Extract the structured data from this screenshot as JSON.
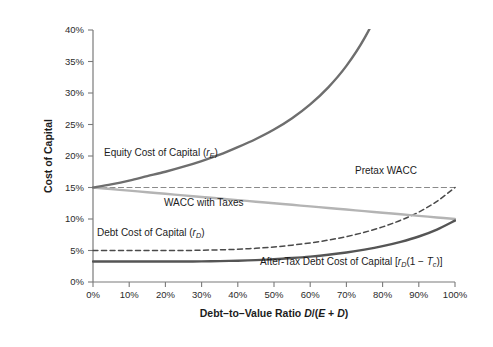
{
  "chart_data": {
    "type": "line",
    "title": "",
    "xlabel": "Debt-to-Value Ratio D/(E + D)",
    "ylabel": "Cost of Capital",
    "xlim": [
      0,
      100
    ],
    "ylim": [
      0,
      40
    ],
    "grid": false,
    "legend_position": "inline-annotations",
    "x_tick_labels": [
      "0%",
      "10%",
      "20%",
      "30%",
      "40%",
      "50%",
      "60%",
      "70%",
      "80%",
      "90%",
      "100%"
    ],
    "x_ticks": [
      0,
      10,
      20,
      30,
      40,
      50,
      60,
      70,
      80,
      90,
      100
    ],
    "y_tick_labels": [
      "0%",
      "5%",
      "10%",
      "15%",
      "20%",
      "25%",
      "30%",
      "35%",
      "40%"
    ],
    "y_ticks": [
      0,
      5,
      10,
      15,
      20,
      25,
      30,
      35,
      40
    ],
    "x": [
      0,
      5,
      10,
      15,
      20,
      25,
      30,
      35,
      40,
      45,
      50,
      55,
      60,
      65,
      70,
      75,
      80,
      85,
      90,
      95,
      100
    ],
    "series": [
      {
        "name": "Equity Cost of Capital",
        "label": "Equity Cost of Capital (rE)",
        "color": "#6e6e6e",
        "style": "solid",
        "width": 2.4,
        "values": [
          15.0,
          15.5,
          16.1,
          16.8,
          17.5,
          18.3,
          19.2,
          20.2,
          21.4,
          22.7,
          24.2,
          26.0,
          28.2,
          30.9,
          34.3,
          38.7,
          44.6,
          52.8,
          65.0,
          85.0,
          125.0
        ]
      },
      {
        "name": "Pretax WACC",
        "label": "Pretax WACC",
        "color": "#8a8a8a",
        "style": "dashed",
        "width": 1.2,
        "values": [
          15.0,
          15.0,
          15.0,
          15.0,
          15.0,
          15.0,
          15.0,
          15.0,
          15.0,
          15.0,
          15.0,
          15.0,
          15.0,
          15.0,
          15.0,
          15.0,
          15.0,
          15.0,
          15.0,
          15.0,
          15.0
        ]
      },
      {
        "name": "WACC with Taxes",
        "label": "WACC with Taxes",
        "color": "#b4b4b4",
        "style": "solid",
        "width": 2.4,
        "values": [
          15.0,
          14.75,
          14.5,
          14.25,
          14.0,
          13.75,
          13.5,
          13.25,
          13.0,
          12.75,
          12.5,
          12.25,
          12.0,
          11.75,
          11.5,
          11.25,
          11.0,
          10.75,
          10.5,
          10.25,
          10.0
        ]
      },
      {
        "name": "Debt Cost of Capital",
        "label": "Debt Cost of Capital (rD)",
        "color": "#4a4a4a",
        "style": "dashed",
        "width": 1.5,
        "values": [
          5.0,
          5.0,
          5.0,
          5.0,
          5.0,
          5.0,
          5.05,
          5.1,
          5.2,
          5.35,
          5.55,
          5.85,
          6.2,
          6.65,
          7.2,
          7.9,
          8.75,
          9.8,
          11.1,
          12.8,
          15.0
        ]
      },
      {
        "name": "After-Tax Debt Cost of Capital",
        "label": "After-Tax Debt Cost of Capital [rD(1 - Tc)]",
        "color": "#555555",
        "style": "solid",
        "width": 2.4,
        "values": [
          3.25,
          3.25,
          3.25,
          3.25,
          3.25,
          3.25,
          3.28,
          3.32,
          3.38,
          3.48,
          3.61,
          3.8,
          4.03,
          4.32,
          4.68,
          5.14,
          5.69,
          6.37,
          7.22,
          8.32,
          9.75
        ]
      }
    ],
    "annotations": [
      {
        "id": "equity-label",
        "text": "Equity Cost of Capital (rE)",
        "x_px": 104,
        "y_px": 156
      },
      {
        "id": "pretax-wacc-label",
        "text": "Pretax WACC",
        "x_px": 355,
        "y_px": 174
      },
      {
        "id": "wacc-taxes-label",
        "text": "WACC with Taxes",
        "x_px": 164,
        "y_px": 206
      },
      {
        "id": "debt-cost-label",
        "text": "Debt Cost of Capital (rD)",
        "x_px": 97,
        "y_px": 236
      },
      {
        "id": "after-tax-label",
        "text": "After-Tax Debt Cost of Capital [rD(1 - Tc)]",
        "x_px": 260,
        "y_px": 265
      }
    ],
    "annotation_parts": {
      "equity_main": "Equity Cost of Capital (",
      "equity_var": "r",
      "equity_sub": "E",
      "equity_close": ")",
      "pretax": "Pretax WACC",
      "wacc_taxes": "WACC with Taxes",
      "debt_main": "Debt Cost of Capital (",
      "debt_var": "r",
      "debt_sub": "D",
      "debt_close": ")",
      "aftertax_main": "After-Tax Debt Cost of Capital [",
      "aftertax_var": "r",
      "aftertax_sub": "D",
      "aftertax_mid": "(1 − ",
      "aftertax_var2": "T",
      "aftertax_sub2": "c",
      "aftertax_close": ")]"
    },
    "xlabel_parts": {
      "main": "Debt–to–Value Ratio ",
      "d1": "D",
      "slash": "/(",
      "e": "E",
      "plus": " + ",
      "d2": "D",
      "close": ")"
    }
  },
  "colors": {
    "background": "#ffffff",
    "axis": "#7a7a7a",
    "text": "#1c1c1c"
  }
}
